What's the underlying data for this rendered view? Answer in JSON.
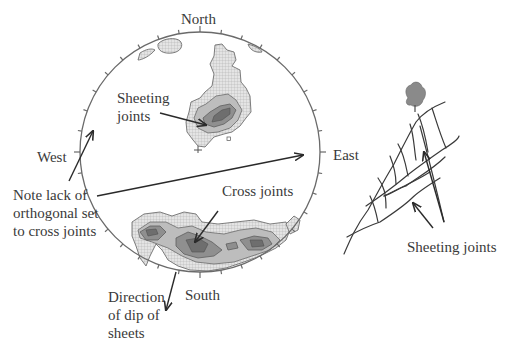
{
  "figure": {
    "type": "stereonet-with-field-sketch",
    "stereonet": {
      "directions": {
        "north": "North",
        "south": "South",
        "east": "East",
        "west": "West"
      },
      "annotations": {
        "sheeting_joints_line1": "Sheeting",
        "sheeting_joints_line2": "joints",
        "cross_joints": "Cross joints",
        "note_line1": "Note lack of",
        "note_line2": "orthogonal set",
        "note_line3": "to cross joints",
        "dip_line1": "Direction",
        "dip_line2": "of dip of",
        "dip_line3": "sheets"
      },
      "clusters": [
        {
          "name": "Sheeting joints",
          "position": "upper-center / north-east of center"
        },
        {
          "name": "Cross joints",
          "position": "southern margin, elongated east-west"
        }
      ],
      "colors": {
        "net_outline": "#6a6a6a",
        "contour_low": "#d9d9d9",
        "contour_mid": "#bdbdbd",
        "contour_high": "#8f8f8f",
        "contour_peak": "#6e6e6e"
      }
    },
    "sketch": {
      "label": "Sheeting joints",
      "features": [
        "tree on hilltop",
        "curved sheeting joints parallel to slope",
        "cross joints between sheets"
      ]
    }
  }
}
